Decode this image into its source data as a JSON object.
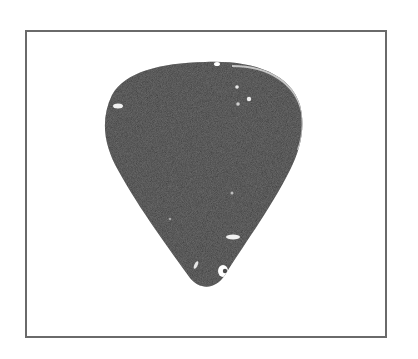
{
  "image": {
    "subject": "guitar pick",
    "description": "Dark gray celluloid guitar pick with light speckles, shown inside a thin gray rectangular frame on white background",
    "colors": {
      "background": "#ffffff",
      "frame_border": "#6a6a6a",
      "pick_body": "#3c3c3c",
      "pick_edge_highlight": "#d8d8d8",
      "speckle": "#f2f2f2"
    }
  }
}
